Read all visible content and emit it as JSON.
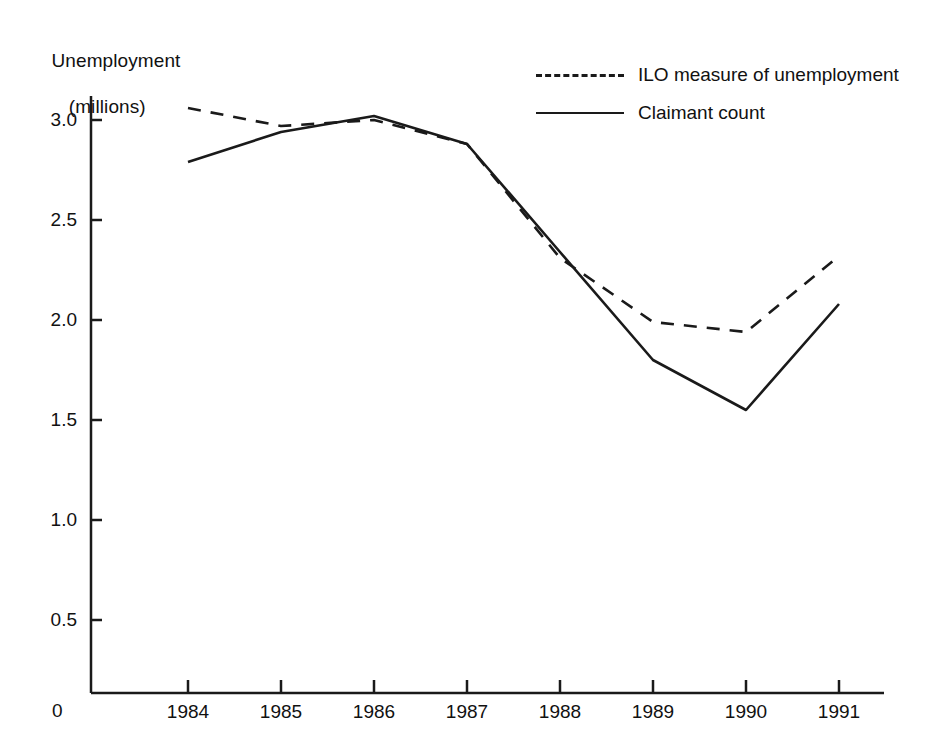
{
  "chart_data": {
    "type": "line",
    "title": "",
    "xlabel": "",
    "ylabel": "Unemployment (millions)",
    "ylabel_line1": "Unemployment",
    "ylabel_line2": "(millions)",
    "grid": false,
    "legend_position": "top-right",
    "x": [
      1984,
      1985,
      1986,
      1987,
      1988,
      1989,
      1990,
      1991
    ],
    "categories": [
      "1984",
      "1985",
      "1986",
      "1987",
      "1988",
      "1989",
      "1990",
      "1991"
    ],
    "xtick_labels": [
      "1984",
      "1985",
      "1986",
      "1987",
      "1988",
      "1989",
      "1990",
      "1991"
    ],
    "ytick_labels": [
      "0.5",
      "1.0",
      "1.5",
      "2.0",
      "2.5",
      "3.0"
    ],
    "ytick_values": [
      0.5,
      1.0,
      1.5,
      2.0,
      2.5,
      3.0
    ],
    "origin_label": "0",
    "xlim": [
      1983.0,
      1991.6
    ],
    "ylim": [
      0,
      3.35
    ],
    "series": [
      {
        "name": "ILO measure of unemployment",
        "style": "dashed",
        "color": "#1a1a1a",
        "values": [
          3.06,
          2.97,
          3.0,
          2.88,
          2.31,
          1.99,
          1.94,
          2.32
        ]
      },
      {
        "name": "Claimant count",
        "style": "solid",
        "color": "#1a1a1a",
        "values": [
          2.79,
          2.94,
          3.02,
          2.88,
          2.34,
          1.8,
          1.55,
          2.08
        ]
      }
    ]
  },
  "legend": {
    "items": [
      {
        "label": "ILO measure of unemployment",
        "style": "dashed"
      },
      {
        "label": "Claimant count",
        "style": "solid"
      }
    ]
  }
}
